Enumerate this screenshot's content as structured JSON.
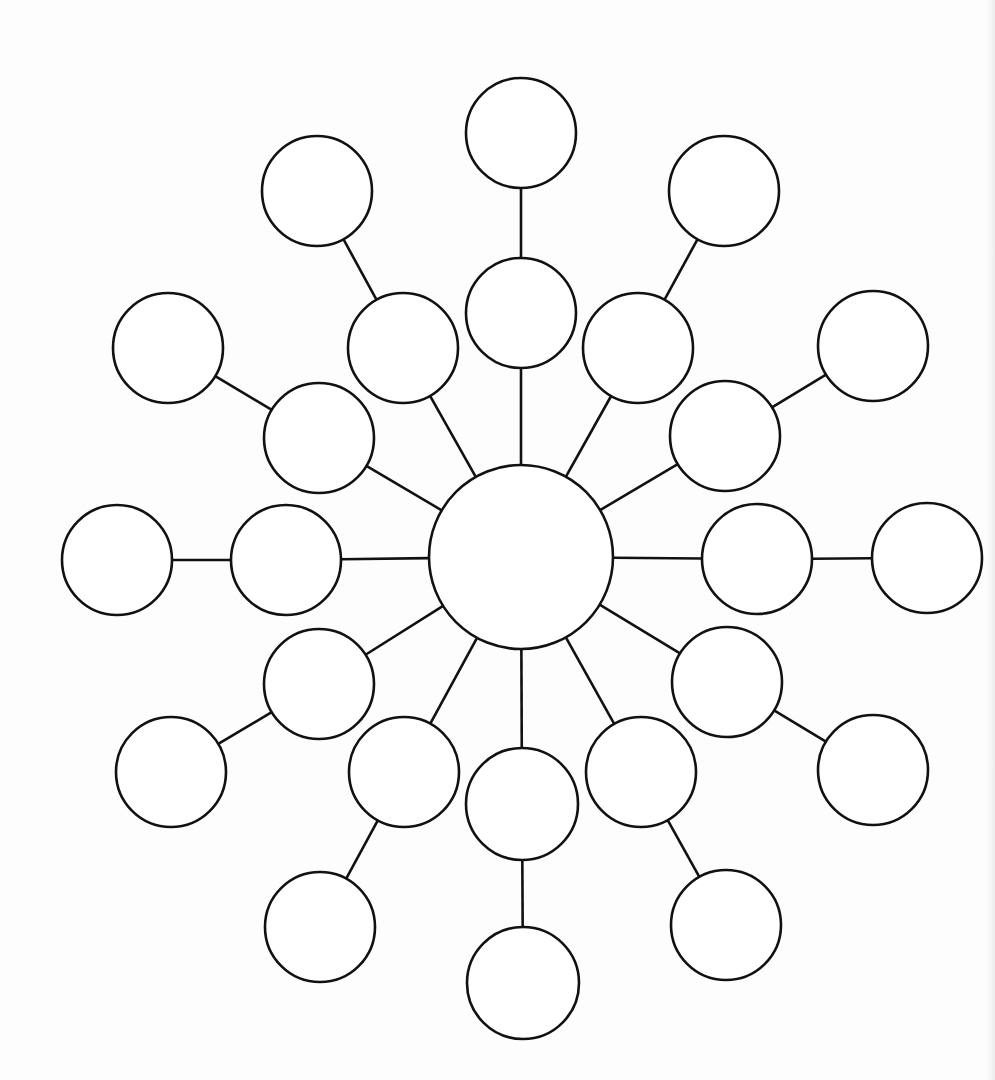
{
  "diagram": {
    "type": "bubble-map",
    "stroke_color": "#111111",
    "fill_color": "#ffffff",
    "background_color": "#fdfdfd",
    "center": {
      "id": "center",
      "x": 521,
      "y": 557,
      "r": 92,
      "label": ""
    },
    "branches": [
      {
        "angle": 90,
        "inner": {
          "x": 521,
          "y": 313,
          "r": 55,
          "label": ""
        },
        "outer": {
          "x": 521,
          "y": 133,
          "r": 55,
          "label": ""
        }
      },
      {
        "angle": 60,
        "inner": {
          "x": 638,
          "y": 348,
          "r": 55,
          "label": ""
        },
        "outer": {
          "x": 724,
          "y": 191,
          "r": 55,
          "label": ""
        }
      },
      {
        "angle": 30,
        "inner": {
          "x": 725,
          "y": 436,
          "r": 55,
          "label": ""
        },
        "outer": {
          "x": 873,
          "y": 346,
          "r": 55,
          "label": ""
        }
      },
      {
        "angle": 0,
        "inner": {
          "x": 757,
          "y": 559,
          "r": 55,
          "label": ""
        },
        "outer": {
          "x": 927,
          "y": 558,
          "r": 55,
          "label": ""
        }
      },
      {
        "angle": 330,
        "inner": {
          "x": 727,
          "y": 682,
          "r": 55,
          "label": ""
        },
        "outer": {
          "x": 873,
          "y": 770,
          "r": 55,
          "label": ""
        }
      },
      {
        "angle": 300,
        "inner": {
          "x": 641,
          "y": 772,
          "r": 55,
          "label": ""
        },
        "outer": {
          "x": 726,
          "y": 925,
          "r": 55,
          "label": ""
        }
      },
      {
        "angle": 270,
        "inner": {
          "x": 522,
          "y": 804,
          "r": 56,
          "label": ""
        },
        "outer": {
          "x": 523,
          "y": 983,
          "r": 56,
          "label": ""
        }
      },
      {
        "angle": 240,
        "inner": {
          "x": 404,
          "y": 772,
          "r": 55,
          "label": ""
        },
        "outer": {
          "x": 320,
          "y": 927,
          "r": 55,
          "label": ""
        }
      },
      {
        "angle": 210,
        "inner": {
          "x": 319,
          "y": 684,
          "r": 55,
          "label": ""
        },
        "outer": {
          "x": 171,
          "y": 772,
          "r": 55,
          "label": ""
        }
      },
      {
        "angle": 180,
        "inner": {
          "x": 286,
          "y": 560,
          "r": 55,
          "label": ""
        },
        "outer": {
          "x": 117,
          "y": 560,
          "r": 55,
          "label": ""
        }
      },
      {
        "angle": 150,
        "inner": {
          "x": 319,
          "y": 438,
          "r": 55,
          "label": ""
        },
        "outer": {
          "x": 168,
          "y": 348,
          "r": 55,
          "label": ""
        }
      },
      {
        "angle": 120,
        "inner": {
          "x": 403,
          "y": 348,
          "r": 55,
          "label": ""
        },
        "outer": {
          "x": 317,
          "y": 191,
          "r": 55,
          "label": ""
        }
      }
    ]
  }
}
